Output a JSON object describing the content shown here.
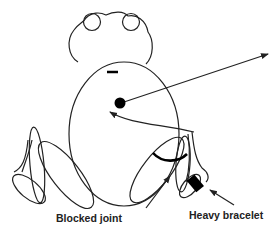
{
  "figure": {
    "labels": {
      "blocked_joint": "Blocked joint",
      "heavy_bracelet": "Heavy bracelet"
    },
    "parts": [
      "head",
      "left-eye",
      "right-eye",
      "body",
      "center-of-mass-dot",
      "force-arrow",
      "return-arrow",
      "left-leg",
      "right-leg",
      "blocked-joint-arc",
      "heavy-bracelet"
    ],
    "colors": {
      "stroke": "#222222",
      "fill": "#000000",
      "background": "#ffffff"
    }
  }
}
